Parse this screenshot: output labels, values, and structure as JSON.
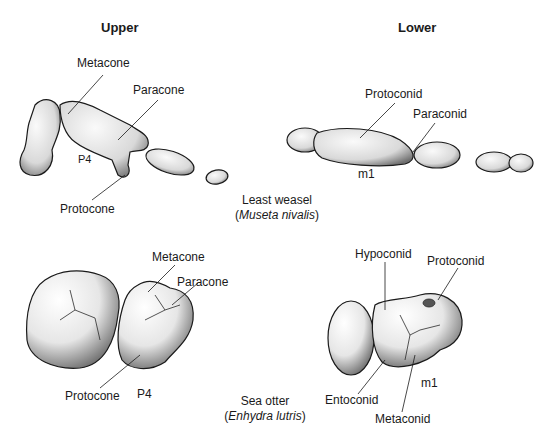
{
  "headers": {
    "upper": "Upper",
    "lower": "Lower"
  },
  "weasel": {
    "common_name": "Least weasel",
    "sci_open": "(",
    "sci_name": "Museta nivalis",
    "sci_close": ")",
    "upper_labels": {
      "metacone": "Metacone",
      "paracone": "Paracone",
      "protocone": "Protocone",
      "tooth": "P4"
    },
    "lower_labels": {
      "protoconid": "Protoconid",
      "paraconid": "Paraconid",
      "tooth": "m1"
    }
  },
  "otter": {
    "common_name": "Sea otter",
    "sci_open": "(",
    "sci_name": "Enhydra lutris",
    "sci_close": ")",
    "upper_labels": {
      "metacone": "Metacone",
      "paracone": "Paracone",
      "protocone": "Protocone",
      "tooth": "P4"
    },
    "lower_labels": {
      "hypoconid": "Hypoconid",
      "protoconid": "Protoconid",
      "entoconid": "Entoconid",
      "metaconid": "Metaconid",
      "tooth": "m1"
    }
  },
  "colors": {
    "ink": "#1a1a1a",
    "shade": "#8a8a8a",
    "fill": "#f2f2f2"
  }
}
